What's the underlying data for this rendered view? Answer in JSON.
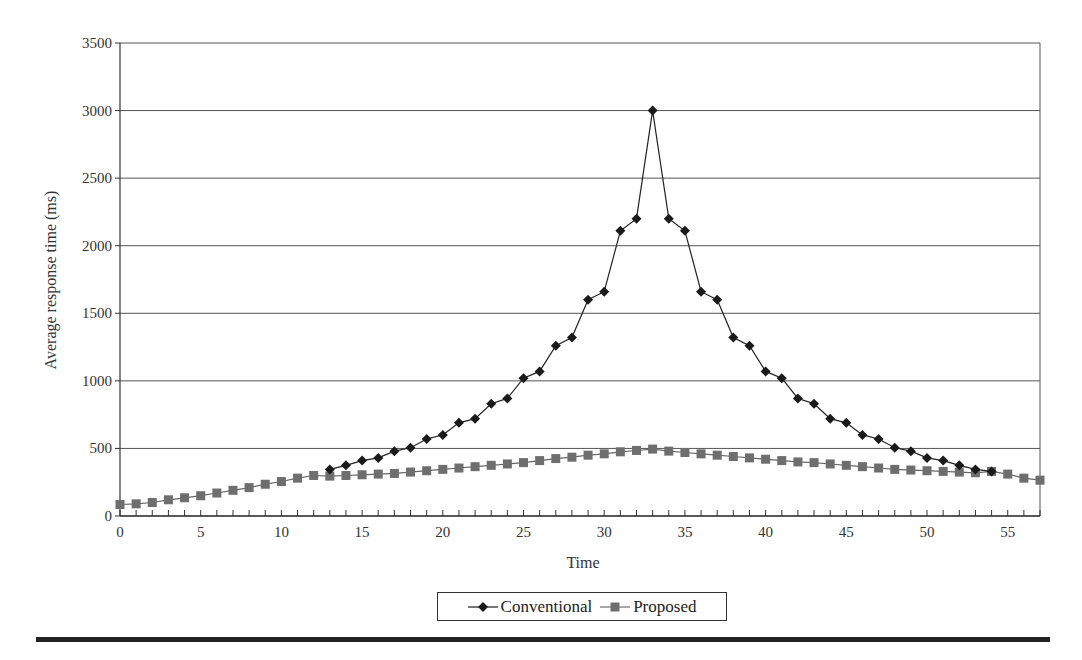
{
  "chart_data": {
    "type": "line",
    "title": "",
    "xlabel": "Time",
    "ylabel": "Average response time (ms)",
    "xlim": [
      0,
      57
    ],
    "ylim": [
      0,
      3500
    ],
    "x_ticks": [
      0,
      5,
      10,
      15,
      20,
      25,
      30,
      35,
      40,
      45,
      50,
      55
    ],
    "y_ticks": [
      0,
      500,
      1000,
      1500,
      2000,
      2500,
      3000,
      3500
    ],
    "grid": "horizontal",
    "legend_position": "bottom",
    "series": [
      {
        "name": "Conventional",
        "marker": "diamond",
        "color": "#1a1a1a",
        "x": [
          13,
          14,
          15,
          16,
          17,
          18,
          19,
          20,
          21,
          22,
          23,
          24,
          25,
          26,
          27,
          28,
          29,
          30,
          31,
          32,
          33,
          34,
          35,
          36,
          37,
          38,
          39,
          40,
          41,
          42,
          43,
          44,
          45,
          46,
          47,
          48,
          49,
          50,
          51,
          52,
          53,
          54
        ],
        "values": [
          345,
          375,
          410,
          430,
          480,
          505,
          570,
          600,
          690,
          720,
          830,
          870,
          1020,
          1070,
          1260,
          1320,
          1600,
          1660,
          2110,
          2200,
          3000,
          2200,
          2110,
          1660,
          1600,
          1320,
          1260,
          1070,
          1020,
          870,
          830,
          720,
          690,
          600,
          570,
          505,
          480,
          430,
          410,
          375,
          345,
          330
        ]
      },
      {
        "name": "Proposed",
        "marker": "square",
        "color": "#6e6e6e",
        "x": [
          0,
          1,
          2,
          3,
          4,
          5,
          6,
          7,
          8,
          9,
          10,
          11,
          12,
          13,
          14,
          15,
          16,
          17,
          18,
          19,
          20,
          21,
          22,
          23,
          24,
          25,
          26,
          27,
          28,
          29,
          30,
          31,
          32,
          33,
          34,
          35,
          36,
          37,
          38,
          39,
          40,
          41,
          42,
          43,
          44,
          45,
          46,
          47,
          48,
          49,
          50,
          51,
          52,
          53,
          54,
          55,
          56,
          57
        ],
        "values": [
          85,
          90,
          100,
          120,
          135,
          150,
          170,
          190,
          210,
          235,
          255,
          280,
          300,
          295,
          300,
          305,
          310,
          315,
          325,
          335,
          345,
          355,
          365,
          375,
          385,
          395,
          410,
          425,
          435,
          450,
          460,
          475,
          485,
          495,
          480,
          470,
          460,
          450,
          440,
          430,
          420,
          410,
          400,
          395,
          385,
          375,
          365,
          355,
          345,
          340,
          335,
          330,
          325,
          320,
          330,
          310,
          280,
          265
        ]
      }
    ]
  },
  "legend": {
    "items": [
      {
        "label": "Conventional",
        "icon": "diamond-marker-line-icon"
      },
      {
        "label": "Proposed",
        "icon": "square-marker-line-icon"
      }
    ]
  }
}
